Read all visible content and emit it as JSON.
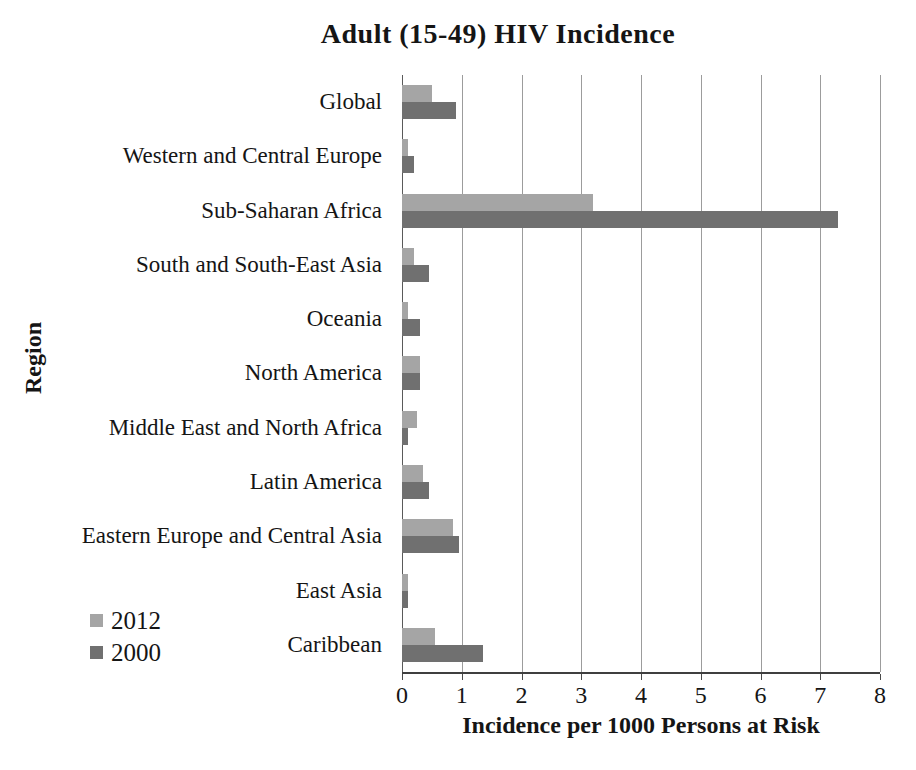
{
  "chart_data": {
    "type": "bar",
    "orientation": "horizontal",
    "title": "Adult (15-49) HIV Incidence",
    "xlabel": "Incidence per 1000 Persons at Risk",
    "ylabel": "Region",
    "xlim": [
      0,
      8
    ],
    "x_ticks": [
      0,
      1,
      2,
      3,
      4,
      5,
      6,
      7,
      8
    ],
    "grid": true,
    "legend_position": "lower-left",
    "categories": [
      "Global",
      "Western and Central Europe",
      "Sub-Saharan Africa",
      "South and South-East Asia",
      "Oceania",
      "North America",
      "Middle East and North Africa",
      "Latin America",
      "Eastern Europe and Central Asia",
      "East Asia",
      "Caribbean"
    ],
    "series": [
      {
        "name": "2012",
        "color": "#a5a5a5",
        "values": [
          0.5,
          0.1,
          3.2,
          0.2,
          0.1,
          0.3,
          0.25,
          0.35,
          0.85,
          0.1,
          0.55
        ]
      },
      {
        "name": "2000",
        "color": "#707070",
        "values": [
          0.9,
          0.2,
          7.3,
          0.45,
          0.3,
          0.3,
          0.1,
          0.45,
          0.95,
          0.1,
          1.35
        ]
      }
    ]
  },
  "colors": {
    "background": "#ffffff",
    "gridline": "#9c9c9c",
    "axis": "#3f3f3f",
    "text": "#151515",
    "series_2012": "#a5a5a5",
    "series_2000": "#707070"
  }
}
